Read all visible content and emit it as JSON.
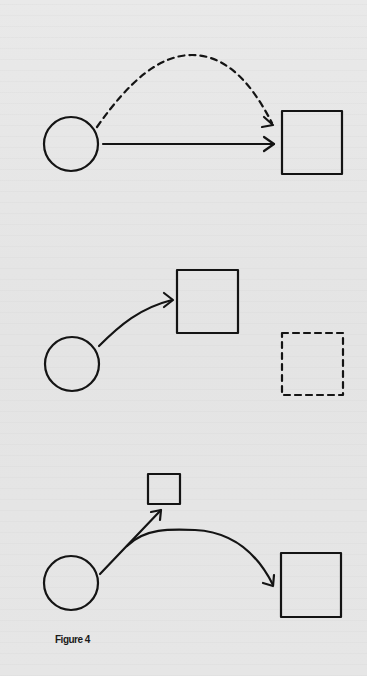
{
  "figure": {
    "caption": "Figure 4",
    "background_color": "#e7e7e7",
    "ink_color": "#141414",
    "panels": [
      {
        "id": 1,
        "description": "Circle with a solid straight arrow and a dashed arched arrow, both pointing to a square",
        "shapes": [
          {
            "type": "circle",
            "style": "solid",
            "cx": 71,
            "cy": 144,
            "r": 27
          },
          {
            "type": "square",
            "style": "solid",
            "x": 282,
            "y": 111,
            "w": 60,
            "h": 63
          }
        ],
        "arrows": [
          {
            "style": "dashed",
            "shape": "arc",
            "from": [
              97,
              127
            ],
            "to": [
              273,
              125
            ]
          },
          {
            "style": "solid",
            "shape": "straight",
            "from": [
              103,
              144
            ],
            "to": [
              274,
              144
            ]
          }
        ]
      },
      {
        "id": 2,
        "description": "Circle with a curved solid arrow to a square; a separate dashed square below right",
        "shapes": [
          {
            "type": "circle",
            "style": "solid",
            "cx": 72,
            "cy": 364,
            "r": 27
          },
          {
            "type": "square",
            "style": "solid",
            "x": 177,
            "y": 270,
            "w": 61,
            "h": 63
          },
          {
            "type": "square",
            "style": "dashed",
            "x": 282,
            "y": 333,
            "w": 61,
            "h": 62
          }
        ],
        "arrows": [
          {
            "style": "solid",
            "shape": "curve",
            "from": [
              99,
              346
            ],
            "to": [
              173,
              300
            ]
          }
        ]
      },
      {
        "id": 3,
        "description": "Circle with a straight arrow to a small square and a branching curved arrow to a large square",
        "shapes": [
          {
            "type": "circle",
            "style": "solid",
            "cx": 71,
            "cy": 583,
            "r": 27
          },
          {
            "type": "square",
            "style": "solid",
            "x": 148,
            "y": 474,
            "w": 32,
            "h": 30
          },
          {
            "type": "square",
            "style": "solid",
            "x": 281,
            "y": 553,
            "w": 60,
            "h": 64
          }
        ],
        "arrows": [
          {
            "style": "solid",
            "shape": "straight",
            "from": [
              100,
              574
            ],
            "to": [
              161,
              510
            ]
          },
          {
            "style": "solid",
            "shape": "curve",
            "from": [
              127,
              546
            ],
            "to": [
              273,
              585
            ]
          }
        ]
      }
    ]
  }
}
